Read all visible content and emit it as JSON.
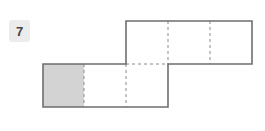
{
  "problem": {
    "number": "7"
  },
  "diagram": {
    "type": "cube-net",
    "cell_size": 42,
    "top_row": {
      "x": 126,
      "y": 21,
      "cells": 3
    },
    "bottom_row": {
      "x": 43,
      "y": 64,
      "cells": 3
    },
    "shaded_cell": "bottom_row.0",
    "colors": {
      "outline": "#6e6e6e",
      "dashed": "#8a8a8a",
      "shade": "#d3d3d3"
    }
  }
}
